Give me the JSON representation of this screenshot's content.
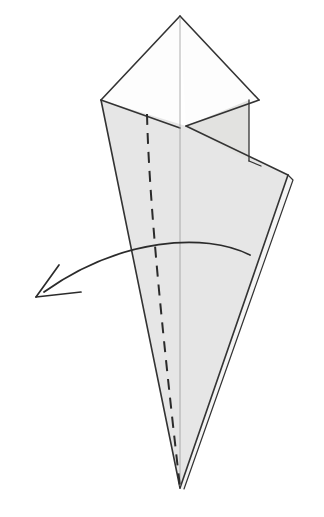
{
  "figure": {
    "kind": "origami-folding-diagram",
    "title": "Origami step diagram: cone-shaped model with valley fold and fold-over arrow",
    "canvas": {
      "width": 324,
      "height": 517,
      "background": "#ffffff"
    },
    "style": {
      "paper_shaded_fill": "#e6e6e6",
      "paper_white_fill": "#fdfdfd",
      "paper_overlap_fill": "#dededc",
      "outline_stroke": "#333333",
      "thin_crease_stroke": "#9a9a9a",
      "dashed_fold_stroke": "#2b2b2b",
      "arrow_stroke": "#2b2b2b",
      "outline_width": 1.6,
      "thin_width": 0.7,
      "dashed_width": 2,
      "dash_pattern": "11 8"
    },
    "parts": [
      {
        "name": "top-left-white-flap",
        "label": "Upper left white triangular flap",
        "fill": "#fdfdfd",
        "points": "180,16 101,100 180,128"
      },
      {
        "name": "top-right-white-flap",
        "label": "Upper right white triangular flap",
        "fill": "#fdfdfd",
        "points": "180,16 259,100 186,126"
      },
      {
        "name": "main-cone-body",
        "label": "Main shaded cone body front layer",
        "fill": "#e6e6e6",
        "points": "101,100 186,126 288,175 180,488"
      },
      {
        "name": "right-upper-shaded-flap",
        "label": "Small shaded flap at upper right",
        "fill": "#e2e2e0",
        "points": "186,126 249,100 249,161"
      },
      {
        "name": "back-layer-sliver",
        "label": "Back paper layer visible along right edge",
        "fill": "#f4f4f4",
        "points": "288,175 293,179 184,489 180,488"
      }
    ],
    "outlines": [
      {
        "name": "top-apex-left-edge",
        "d": "M180,16 L101,100"
      },
      {
        "name": "top-apex-right-edge",
        "d": "M180,16 L259,100"
      },
      {
        "name": "left-white-flap-lower-edge",
        "d": "M101,100 L180,128"
      },
      {
        "name": "right-white-flap-lower-edge",
        "d": "M259,100 L186,126"
      },
      {
        "name": "cone-left-edge",
        "d": "M101,100 L180,488"
      },
      {
        "name": "cone-horizon-edge",
        "d": "M186,126 L288,175"
      },
      {
        "name": "cone-right-edge",
        "d": "M288,175 L180,488"
      },
      {
        "name": "back-layer-edge",
        "d": "M288,175 L293,180 L184,489"
      },
      {
        "name": "right-flap-vertical-edge",
        "d": "M249,100 L249,161"
      },
      {
        "name": "right-flap-to-horizon",
        "d": "M249,161 L261,166"
      }
    ],
    "creases": [
      {
        "name": "center-vertical-crease",
        "kind": "thin-line",
        "d": "M180,17 L180,486"
      },
      {
        "name": "valley-fold-line",
        "kind": "dashed",
        "d": "M147,114 C149,200 162,330 180,487"
      }
    ],
    "arrow": {
      "name": "fold-over-arrow",
      "kind": "curved-arrow",
      "meaning": "fold the flap over to the left",
      "shaft": "M250,255 C205,232 120,238 44,292",
      "head_tip": [
        36,
        297
      ],
      "head_barb_upper": [
        59,
        265
      ],
      "head_barb_lower": [
        81,
        292
      ]
    }
  }
}
